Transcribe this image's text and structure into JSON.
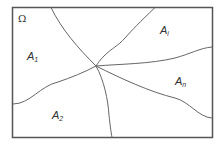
{
  "diagram": {
    "frame_color": "#555555",
    "curve_color": "#666666",
    "center_point": [
      96,
      66
    ],
    "regions": [
      {
        "id": "omega",
        "symbol": "Ω",
        "sub": ""
      },
      {
        "id": "a1",
        "symbol": "A",
        "sub": "1"
      },
      {
        "id": "ai",
        "symbol": "A",
        "sub": "i"
      },
      {
        "id": "an",
        "symbol": "A",
        "sub": "n"
      },
      {
        "id": "a2",
        "symbol": "A",
        "sub": "2"
      }
    ]
  }
}
